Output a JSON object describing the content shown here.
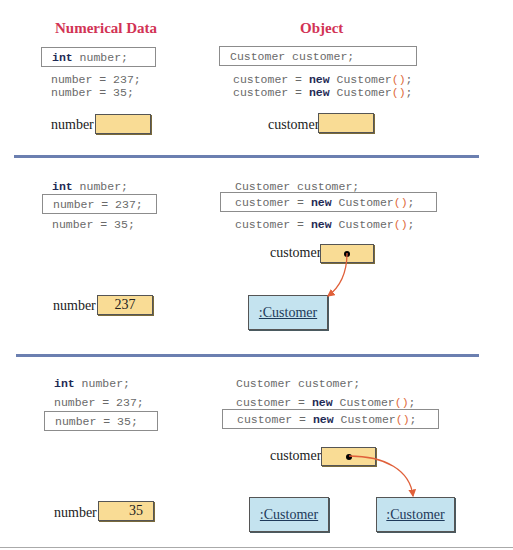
{
  "headers": {
    "left": "Numerical Data",
    "right": "Object"
  },
  "code": {
    "int_kw": "int",
    "decl_num_rest": " number;",
    "assign_237": "number = 237;",
    "assign_35": "number = 35;",
    "decl_obj": "Customer customer;",
    "new_lhs": "customer = ",
    "new_kw": "new",
    "new_type": " Customer",
    "new_paren": "()",
    "new_semi": ";"
  },
  "labels": {
    "number": "number",
    "customer": "customer"
  },
  "panels": [
    {
      "highlight_left": "int number;",
      "highlight_right": "Customer customer;",
      "number_value": "",
      "customer_ref": "none",
      "objects": []
    },
    {
      "highlight_left": "number = 237;",
      "highlight_right": "customer = new Customer();",
      "number_value": "237",
      "customer_ref": "object-1",
      "objects": [
        ":Customer"
      ]
    },
    {
      "highlight_left": "number = 35;",
      "highlight_right": "customer = new Customer();",
      "number_value": "35",
      "customer_ref": "object-2",
      "objects": [
        ":Customer",
        ":Customer"
      ]
    }
  ],
  "colors": {
    "header": "#d23355",
    "cell_fill": "#f9dc95",
    "object_fill": "#c4e3ef",
    "arrow": "#e0603a",
    "divider": "#6b7fb0"
  }
}
